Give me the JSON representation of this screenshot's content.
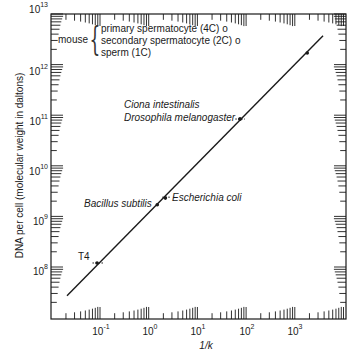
{
  "chart_data": {
    "type": "line",
    "title": "",
    "xlabel": "1/k",
    "ylabel": "DNA per cell (molecular weight in daltons)",
    "xscale": "log",
    "yscale": "log",
    "xlim": [
      0.01,
      11000
    ],
    "ylim": [
      10000000.0,
      10000000000000.0
    ],
    "x_ticks": [
      "10^-1",
      "10^0",
      "10^1",
      "10^2",
      "10^3"
    ],
    "y_ticks": [
      "10^8",
      "10^9",
      "10^10",
      "10^11",
      "10^12",
      "10^13"
    ],
    "grid": false,
    "fit_line": {
      "x": [
        0.021,
        3800
      ],
      "y": [
        27000000.0,
        3700000000000.0
      ]
    },
    "points": [
      {
        "label": "T4",
        "x": 0.087,
        "y": 120000000.0
      },
      {
        "label": "Bacillus subtilis",
        "x": 1.5,
        "y": 1700000000.0
      },
      {
        "label": "Escherichia coli",
        "x": 2.2,
        "y": 2300000000.0
      },
      {
        "label": "Drosophila melanogaster",
        "x": 75,
        "y": 84000000000.0
      },
      {
        "label": "Ciona intestinalis",
        "x": 75,
        "y": 84000000000.0
      },
      {
        "label": "mouse",
        "x": 1800,
        "y": 1700000000000.0
      }
    ],
    "annotations": {
      "mouse_group": "mouse",
      "mouse_items": [
        "primary spermatocyte (4C) o",
        "secondary spermatocyte (2C) o",
        "sperm (1C)"
      ]
    }
  },
  "labels": {
    "mouse": "mouse",
    "primary": "primary spermatocyte (4C) o",
    "secondary": "secondary spermatocyte (2C) o",
    "sperm": "sperm (1C)",
    "ciona": "Ciona intestinalis",
    "drosophila": "Drosophila melanogaster",
    "bacillus": "Bacillus subtilis",
    "ecoli": "Escherichia coli",
    "t4": "T4",
    "xlabel": "1/k",
    "ylabel": "DNA per cell (molecular weight in daltons)"
  },
  "yticks": [
    {
      "base": "10",
      "exp": "13"
    },
    {
      "base": "10",
      "exp": "12"
    },
    {
      "base": "10",
      "exp": "11"
    },
    {
      "base": "10",
      "exp": "10"
    },
    {
      "base": "10",
      "exp": "9"
    },
    {
      "base": "10",
      "exp": "8"
    }
  ],
  "xticks": [
    {
      "base": "10",
      "exp": "-1"
    },
    {
      "base": "10",
      "exp": "0"
    },
    {
      "base": "10",
      "exp": "1"
    },
    {
      "base": "10",
      "exp": "2"
    },
    {
      "base": "10",
      "exp": "3"
    }
  ]
}
